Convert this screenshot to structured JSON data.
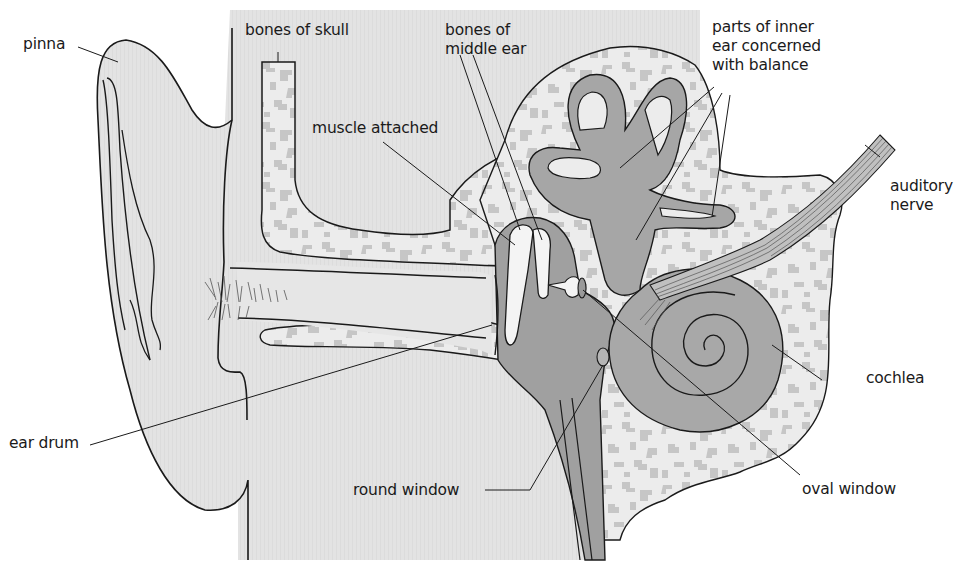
{
  "diagram": {
    "labels": {
      "pinna": "pinna",
      "bones_of_skull": "bones of skull",
      "bones_of_middle_ear": "bones of\nmiddle ear",
      "muscle_attached": "muscle attached",
      "parts_of_inner_ear": "parts of inner\near concerned\nwith balance",
      "auditory_nerve": "auditory\nnerve",
      "cochlea": "cochlea",
      "ear_drum": "ear drum",
      "round_window": "round window",
      "oval_window": "oval window"
    },
    "colors": {
      "background": "#ffffff",
      "outer_tissue": "#e4e4e4",
      "bone_light": "#eeeeee",
      "bone_speckle": "#c4c4c4",
      "fluid_dark": "#a9a9a9",
      "cavity_mid": "#9d9d9d",
      "ossicle": "#f2f2f2",
      "line": "#1a1a1a"
    }
  }
}
